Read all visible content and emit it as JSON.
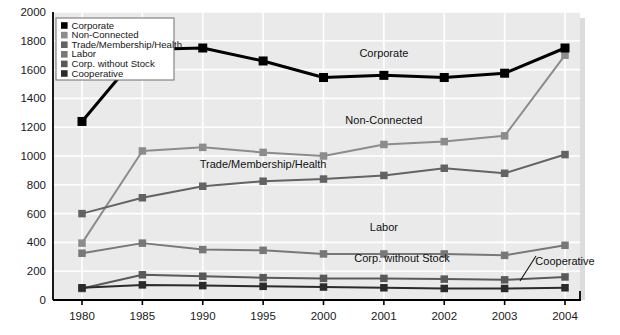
{
  "chart_data": {
    "type": "line",
    "title": "",
    "xlabel": "",
    "ylabel": "",
    "x": [
      "1980",
      "1985",
      "1990",
      "1995",
      "2000",
      "2001",
      "2002",
      "2003",
      "2004"
    ],
    "categories": [
      "1980",
      "1985",
      "1990",
      "1995",
      "2000",
      "2001",
      "2002",
      "2003",
      "2004"
    ],
    "ylim": [
      0,
      2000
    ],
    "yticks": [
      "0",
      "200",
      "400",
      "600",
      "800",
      "1000",
      "1200",
      "1400",
      "1600",
      "1800",
      "2000"
    ],
    "grid": true,
    "legend_position": "top-left",
    "series": [
      {
        "name": "Corporate",
        "color": "#000000",
        "marker": "square",
        "values": [
          1240,
          1740,
          1750,
          1660,
          1545,
          1560,
          1545,
          1575,
          1750
        ]
      },
      {
        "name": "Non-Connected",
        "color": "#8c8c8c",
        "marker": "square",
        "values": [
          395,
          1035,
          1060,
          1025,
          1000,
          1080,
          1100,
          1140,
          1700
        ]
      },
      {
        "name": "Trade/Membership/Health",
        "color": "#636363",
        "marker": "square",
        "values": [
          600,
          710,
          790,
          825,
          840,
          865,
          915,
          880,
          1010
        ]
      },
      {
        "name": "Labor",
        "color": "#787878",
        "marker": "square",
        "values": [
          325,
          395,
          350,
          345,
          320,
          320,
          320,
          310,
          380
        ]
      },
      {
        "name": "Corp. without Stock",
        "color": "#5a5a5a",
        "marker": "square",
        "values": [
          80,
          175,
          165,
          155,
          150,
          150,
          145,
          140,
          160
        ]
      },
      {
        "name": "Cooperative",
        "color": "#2b2b2b",
        "marker": "square",
        "values": [
          85,
          105,
          100,
          95,
          90,
          85,
          80,
          80,
          85
        ]
      }
    ],
    "annotations": [
      {
        "text": "Corporate",
        "x": 2001,
        "y": 1690
      },
      {
        "text": "Non-Connected",
        "x": 2001,
        "y": 1225
      },
      {
        "text": "Trade/Membership/Health",
        "x": 1995,
        "y": 915
      },
      {
        "text": "Labor",
        "x": 2001,
        "y": 480
      },
      {
        "text": "Corp. without Stock",
        "x": 2001.3,
        "y": 265
      },
      {
        "text": "Cooperative",
        "x": 2004.2,
        "y": 245
      }
    ]
  },
  "legend": {
    "items": [
      {
        "label": "Corporate",
        "swatch": "#000000"
      },
      {
        "label": "Non-Connected",
        "swatch": "#8c8c8c"
      },
      {
        "label": "Trade/Membership/Health",
        "swatch": "#636363"
      },
      {
        "label": "Labor",
        "swatch": "#787878"
      },
      {
        "label": "Corp. without Stock",
        "swatch": "#5a5a5a"
      },
      {
        "label": "Cooperative",
        "swatch": "#2b2b2b"
      }
    ]
  },
  "colors": {
    "plot_background": "#eaeaea",
    "gridline": "#ffffff",
    "axis": "#000000",
    "page_background": "#ffffff"
  }
}
